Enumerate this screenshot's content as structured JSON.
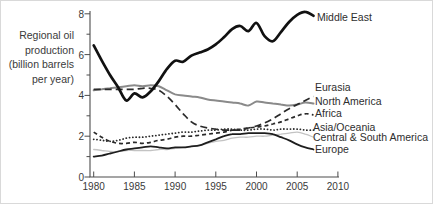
{
  "chart_data": {
    "type": "line",
    "title": "",
    "ylabel_lines": [
      "Regional oil",
      "production",
      "(billion barrels",
      "per year)"
    ],
    "xlabel": "",
    "xlim": [
      1980,
      2010
    ],
    "ylim": [
      0,
      8
    ],
    "grid": false,
    "legend_position": "end-of-line labels at right",
    "x_ticks": [
      1980,
      1985,
      1990,
      1995,
      2000,
      2005,
      2010
    ],
    "y_major_ticks": [
      0,
      2,
      4,
      6,
      8
    ],
    "y_minor_ticks": [
      1,
      3,
      5,
      7
    ],
    "years": [
      1980,
      1981,
      1982,
      1983,
      1984,
      1985,
      1986,
      1987,
      1988,
      1989,
      1990,
      1991,
      1992,
      1993,
      1994,
      1995,
      1996,
      1997,
      1998,
      1999,
      2000,
      2001,
      2002,
      2003,
      2004,
      2005,
      2006,
      2007
    ],
    "series": [
      {
        "name": "North America",
        "color": "#8a8a8a",
        "width": 2.0,
        "dash": "",
        "cap": "round",
        "label": {
          "x": 314,
          "y": 100
        },
        "values": [
          4.25,
          4.3,
          4.35,
          4.4,
          4.45,
          4.5,
          4.45,
          4.5,
          4.45,
          4.25,
          4.05,
          4.0,
          3.95,
          3.9,
          3.8,
          3.75,
          3.7,
          3.65,
          3.6,
          3.5,
          3.7,
          3.65,
          3.6,
          3.55,
          3.5,
          3.55,
          3.65,
          3.6
        ]
      },
      {
        "name": "Central & South America",
        "color": "#c3c3c3",
        "width": 1.3,
        "dash": "",
        "cap": "round",
        "label": {
          "x": 312,
          "y": 136
        },
        "values": [
          1.35,
          1.3,
          1.25,
          1.25,
          1.3,
          1.3,
          1.3,
          1.3,
          1.35,
          1.35,
          1.4,
          1.45,
          1.5,
          1.55,
          1.65,
          1.75,
          1.8,
          1.9,
          1.95,
          1.95,
          2.0,
          2.0,
          2.05,
          2.1,
          2.15,
          2.2,
          2.1,
          1.95
        ]
      },
      {
        "name": "Asia/Oceania",
        "color": "#2a2a2a",
        "width": 1.8,
        "dash": "0.1 3.2",
        "cap": "round",
        "label": {
          "x": 312,
          "y": 126
        },
        "values": [
          1.85,
          1.8,
          1.75,
          1.8,
          1.9,
          1.95,
          1.95,
          2.0,
          2.05,
          2.1,
          2.15,
          2.2,
          2.2,
          2.25,
          2.3,
          2.3,
          2.35,
          2.35,
          2.3,
          2.3,
          2.35,
          2.35,
          2.3,
          2.35,
          2.35,
          2.35,
          2.3,
          2.3
        ]
      },
      {
        "name": "Africa",
        "color": "#2a2a2a",
        "width": 1.7,
        "dash": "4 3",
        "cap": "butt",
        "label": {
          "x": 314,
          "y": 112
        },
        "values": [
          2.2,
          1.95,
          1.75,
          1.65,
          1.65,
          1.7,
          1.65,
          1.7,
          1.8,
          1.85,
          1.95,
          2.0,
          2.0,
          2.05,
          2.1,
          2.15,
          2.2,
          2.3,
          2.35,
          2.4,
          2.45,
          2.5,
          2.6,
          2.7,
          2.85,
          3.0,
          3.1,
          3.05
        ]
      },
      {
        "name": "Eurasia",
        "color": "#2a2a2a",
        "width": 1.7,
        "dash": "7 4",
        "cap": "butt",
        "label": {
          "x": 314,
          "y": 86
        },
        "values": [
          4.3,
          4.3,
          4.3,
          4.3,
          4.3,
          4.3,
          4.35,
          4.35,
          4.25,
          3.95,
          3.55,
          3.1,
          2.7,
          2.5,
          2.4,
          2.35,
          2.3,
          2.3,
          2.3,
          2.4,
          2.5,
          2.65,
          2.85,
          3.1,
          3.35,
          3.55,
          3.75,
          3.95
        ]
      },
      {
        "name": "Europe",
        "color": "#1e1e1e",
        "width": 1.8,
        "dash": "",
        "cap": "round",
        "label": {
          "x": 314,
          "y": 148
        },
        "values": [
          1.0,
          1.05,
          1.15,
          1.25,
          1.35,
          1.4,
          1.45,
          1.5,
          1.45,
          1.4,
          1.45,
          1.45,
          1.5,
          1.55,
          1.7,
          1.85,
          2.0,
          2.1,
          2.1,
          2.15,
          2.15,
          2.15,
          2.1,
          1.95,
          1.8,
          1.6,
          1.45,
          1.35
        ]
      },
      {
        "name": "Middle East",
        "color": "#111111",
        "width": 2.7,
        "dash": "",
        "cap": "round",
        "label": {
          "x": 316,
          "y": 16
        },
        "values": [
          6.45,
          5.7,
          5.0,
          4.4,
          3.75,
          4.1,
          3.9,
          4.2,
          4.7,
          5.3,
          5.7,
          5.65,
          5.95,
          6.1,
          6.25,
          6.5,
          6.85,
          7.25,
          7.4,
          7.15,
          7.55,
          6.9,
          6.65,
          7.1,
          7.6,
          7.95,
          8.1,
          7.9
        ]
      }
    ]
  }
}
